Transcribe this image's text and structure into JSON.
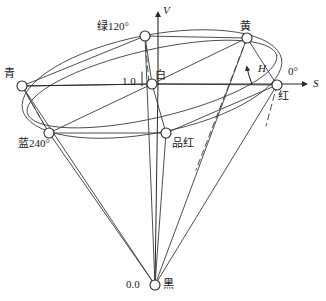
{
  "figure": {
    "type": "hsv-cone-diagram",
    "stroke_color": "#3a3a3a",
    "background": "#ffffff",
    "node_fill": "#ffffff"
  },
  "axes": {
    "vertical": {
      "label": "V",
      "italic": true
    },
    "horizontal": {
      "label": "S",
      "italic": true
    },
    "hue_angle": {
      "label": "H",
      "italic": true
    }
  },
  "values": {
    "top_value": "1.0",
    "bottom_value": "0.0",
    "zero_degree": "0°"
  },
  "nodes": [
    {
      "id": "green",
      "label": "绿120°",
      "x": 145,
      "y": 36,
      "label_x": 97,
      "label_y": 21
    },
    {
      "id": "yellow",
      "label": "黄",
      "x": 247,
      "y": 38,
      "label_x": 240,
      "label_y": 21
    },
    {
      "id": "cyan",
      "label": "青",
      "x": 22,
      "y": 86,
      "label_x": 4,
      "label_y": 68
    },
    {
      "id": "white",
      "label": "白",
      "x": 152,
      "y": 84,
      "label_x": 155,
      "label_y": 70
    },
    {
      "id": "red",
      "label": "红",
      "x": 277,
      "y": 85,
      "label_x": 278,
      "label_y": 91
    },
    {
      "id": "blue",
      "label": "蓝240°",
      "x": 49,
      "y": 133,
      "label_x": 18,
      "label_y": 138
    },
    {
      "id": "magenta",
      "label": "品红",
      "x": 166,
      "y": 133,
      "label_x": 172,
      "label_y": 138
    },
    {
      "id": "black",
      "label": "黑",
      "x": 155,
      "y": 285,
      "label_x": 163,
      "label_y": 279
    }
  ],
  "annotations": {
    "one_point_zero_x": 122,
    "one_point_zero_y": 76,
    "zero_point_zero_x": 126,
    "zero_point_zero_y": 279,
    "zero_degree_x": 288,
    "zero_degree_y": 66,
    "s_label_x": 313,
    "s_label_y": 78,
    "v_label_x": 163,
    "v_label_y": 5,
    "h_label_x": 258,
    "h_label_y": 63
  }
}
